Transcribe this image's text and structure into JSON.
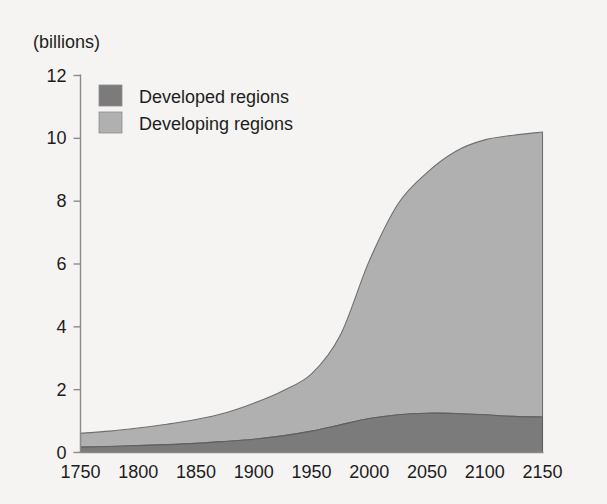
{
  "chart_data": {
    "type": "area",
    "stacked": true,
    "title": "",
    "subtitle": "",
    "xlabel": "",
    "ylabel": "",
    "unit_label": "(billions)",
    "xlim": [
      1750,
      2150
    ],
    "ylim": [
      0,
      12
    ],
    "grid": false,
    "legend_position": "top-left",
    "xticks": [
      1750,
      1800,
      1850,
      1900,
      1950,
      2000,
      2050,
      2100,
      2150
    ],
    "xtick_labels": [
      "1750",
      "1800",
      "1850",
      "1900",
      "1950",
      "2000",
      "2050",
      "2100",
      "2150"
    ],
    "yticks": [
      0,
      2,
      4,
      6,
      8,
      10,
      12
    ],
    "ytick_labels": [
      "0",
      "2",
      "4",
      "6",
      "8",
      "10",
      "12"
    ],
    "x": [
      1750,
      1775,
      1800,
      1825,
      1850,
      1875,
      1900,
      1925,
      1950,
      1975,
      2000,
      2025,
      2050,
      2075,
      2100,
      2125,
      2150
    ],
    "series": [
      {
        "name": "Developed regions",
        "color": "#7b7b7b",
        "values": [
          0.17,
          0.19,
          0.22,
          0.25,
          0.29,
          0.35,
          0.42,
          0.53,
          0.68,
          0.88,
          1.08,
          1.2,
          1.25,
          1.24,
          1.2,
          1.15,
          1.13
        ]
      },
      {
        "name": "Developing regions",
        "color": "#b0b0b0",
        "values": [
          0.44,
          0.49,
          0.56,
          0.65,
          0.76,
          0.91,
          1.15,
          1.43,
          1.82,
          2.86,
          5.02,
          6.72,
          7.66,
          8.35,
          8.75,
          8.95,
          9.07
        ]
      }
    ],
    "totals": [
      0.61,
      0.68,
      0.78,
      0.9,
      1.05,
      1.26,
      1.57,
      1.96,
      2.5,
      3.74,
      6.1,
      7.92,
      8.91,
      9.59,
      9.95,
      10.1,
      10.2
    ]
  },
  "legend": {
    "items": [
      {
        "label": "Developed regions",
        "color": "#7b7b7b"
      },
      {
        "label": "Developing regions",
        "color": "#b0b0b0"
      }
    ]
  },
  "colors": {
    "background": "#f5f4f2",
    "axis": "#8a8a8a",
    "text": "#1d1d1d",
    "developed": "#7b7b7b",
    "developing": "#b0b0b0"
  }
}
